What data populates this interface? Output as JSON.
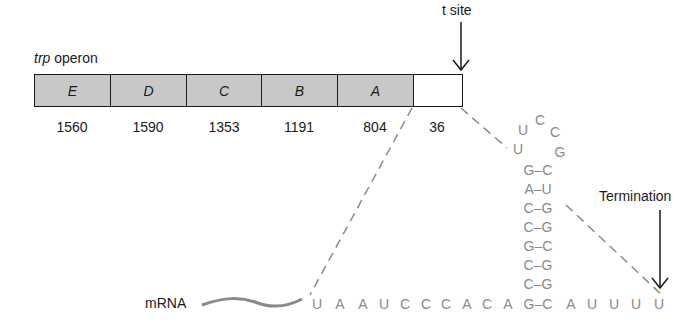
{
  "figure": {
    "title_italic": "trp",
    "title_rest": " operon",
    "t_site_label": "t site",
    "termination_label": "Termination",
    "mrna_label": "mRNA"
  },
  "genes": [
    {
      "name": "E",
      "length": "1560",
      "fill": "#c8c8c8"
    },
    {
      "name": "D",
      "length": "1590",
      "fill": "#c8c8c8"
    },
    {
      "name": "C",
      "length": "1353",
      "fill": "#c8c8c8"
    },
    {
      "name": "B",
      "length": "1191",
      "fill": "#c8c8c8"
    },
    {
      "name": "A",
      "length": "804",
      "fill": "#c8c8c8"
    },
    {
      "name": "",
      "length": "36",
      "fill": "#ffffff"
    }
  ],
  "sequence": {
    "linear_5prime": [
      "U",
      "A",
      "A",
      "U",
      "C",
      "C",
      "C",
      "A",
      "C",
      "A"
    ],
    "stem_base_pair": "G–C",
    "linear_3prime": [
      "A",
      "U",
      "U",
      "U",
      "U"
    ],
    "stem_pairs_bottom_to_top": [
      "C–G",
      "C–G",
      "G–C",
      "C–G",
      "C–G",
      "A–U",
      "G–C"
    ],
    "loop": {
      "left_lower": "U",
      "left_upper": "U",
      "top": "C",
      "right_upper": "C",
      "right_lower": "G"
    }
  },
  "colors": {
    "gene_fill": "#c8c8c8",
    "rna_text": "#8a8a8a",
    "line": "#1a1a1a",
    "dashed": "#8a8a8a"
  }
}
